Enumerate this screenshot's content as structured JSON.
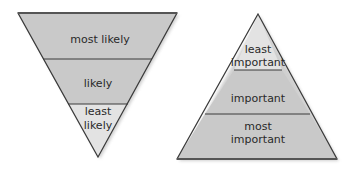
{
  "diagrams": {
    "inverted_triangle": {
      "segments": [
        {
          "lines": [
            "most likely"
          ],
          "fill": "#c9c9c9"
        },
        {
          "lines": [
            "likely"
          ],
          "fill": "#c9c9c9"
        },
        {
          "lines": [
            "least",
            "likely"
          ],
          "fill": "#e3e3e3"
        }
      ]
    },
    "pyramid": {
      "segments": [
        {
          "lines": [
            "least",
            "important"
          ],
          "fill": "#e3e3e3"
        },
        {
          "lines": [
            "important"
          ],
          "fill": "#c9c9c9"
        },
        {
          "lines": [
            "most",
            "important"
          ],
          "fill": "#c9c9c9"
        }
      ]
    }
  },
  "colors": {
    "outline": "#3a3a3a",
    "shadow": "#d8d8d8"
  }
}
